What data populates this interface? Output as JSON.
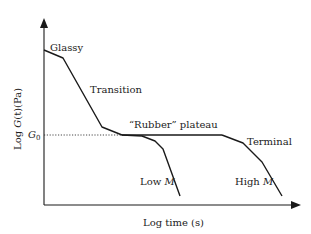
{
  "figure": {
    "type": "schematic",
    "y_axis_label": {
      "prefix": "Log ",
      "symbol": "G",
      "arg": "(t)",
      "unit": "(Pa)"
    },
    "x_axis_label": "Log time (s)",
    "reference_level": {
      "symbol": "G",
      "subscript": "0"
    },
    "annotations": {
      "glassy": "Glassy",
      "transition": "Transition",
      "plateau": "“Rubber” plateau",
      "terminal": "Terminal",
      "low_m_prefix": "Low ",
      "low_m_symbol": "M",
      "high_m_prefix": "High ",
      "high_m_symbol": "M"
    },
    "colors": {
      "curve": "#1a1a1a",
      "axis": "#1a1a1a",
      "reference": "#333333"
    }
  }
}
